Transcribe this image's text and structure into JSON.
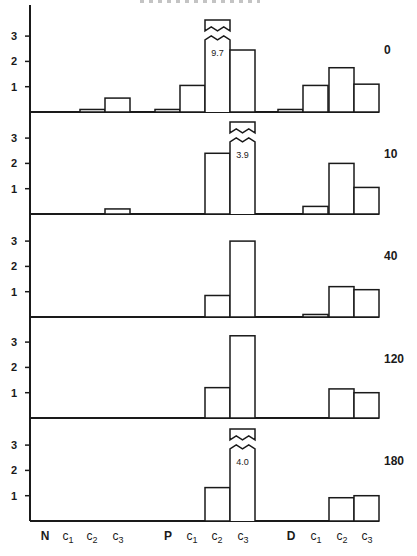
{
  "chart_data": {
    "type": "bar",
    "title": "",
    "xlabel": "",
    "ylabel": "",
    "ylim": [
      0,
      3.5
    ],
    "yticks": [
      1,
      2,
      3
    ],
    "grid": false,
    "layout": "5 stacked panels sharing x-axis; panel label at right",
    "groups": [
      {
        "name": "N",
        "categories": [
          "N",
          "c1",
          "c2",
          "c3"
        ]
      },
      {
        "name": "P",
        "categories": [
          "P",
          "c1",
          "c2",
          "c3"
        ]
      },
      {
        "name": "D",
        "categories": [
          "D",
          "c1",
          "c2",
          "c3"
        ]
      }
    ],
    "categories": [
      "N",
      "N c1",
      "N c2",
      "N c3",
      "P",
      "P c1",
      "P c2",
      "P c3",
      "D",
      "D c1",
      "D c2",
      "D c3"
    ],
    "panels": [
      {
        "label": "0",
        "values": [
          0,
          0,
          0.1,
          0.55,
          0.1,
          1.05,
          9.7,
          2.45,
          0.1,
          1.05,
          1.75,
          1.1
        ],
        "broken_bars": [
          {
            "category": "P c2",
            "value_label": "9.7"
          }
        ]
      },
      {
        "label": "10",
        "values": [
          0,
          0,
          0,
          0.2,
          0,
          0,
          2.4,
          3.9,
          0,
          0.3,
          2.0,
          1.05
        ],
        "broken_bars": [
          {
            "category": "P c3",
            "value_label": "3.9"
          }
        ]
      },
      {
        "label": "40",
        "values": [
          0,
          0,
          0,
          0,
          0,
          0,
          0.85,
          3.0,
          0,
          0.1,
          1.2,
          1.08
        ],
        "broken_bars": []
      },
      {
        "label": "120",
        "values": [
          0,
          0,
          0,
          0,
          0,
          0,
          1.2,
          3.25,
          0,
          0,
          1.15,
          1.0
        ],
        "broken_bars": []
      },
      {
        "label": "180",
        "values": [
          0,
          0,
          0,
          0,
          0,
          0,
          1.32,
          4.0,
          0,
          0,
          0.92,
          1.0
        ],
        "broken_bars": [
          {
            "category": "P c3",
            "value_label": "4.0"
          }
        ]
      }
    ]
  },
  "axis": {
    "y_tick_labels": [
      "1",
      "2",
      "3"
    ],
    "x_labels": [
      {
        "main": "N",
        "sub": ""
      },
      {
        "main": "c",
        "sub": "1"
      },
      {
        "main": "c",
        "sub": "2"
      },
      {
        "main": "c",
        "sub": "3"
      },
      {
        "main": "P",
        "sub": ""
      },
      {
        "main": "c",
        "sub": "1"
      },
      {
        "main": "c",
        "sub": "2"
      },
      {
        "main": "c",
        "sub": "3"
      },
      {
        "main": "D",
        "sub": ""
      },
      {
        "main": "c",
        "sub": "1"
      },
      {
        "main": "c",
        "sub": "2"
      },
      {
        "main": "c",
        "sub": "3"
      }
    ]
  },
  "style": {
    "line_color": "#1a1a1a",
    "bar_fill": "#ffffff",
    "background": "#ffffff"
  }
}
